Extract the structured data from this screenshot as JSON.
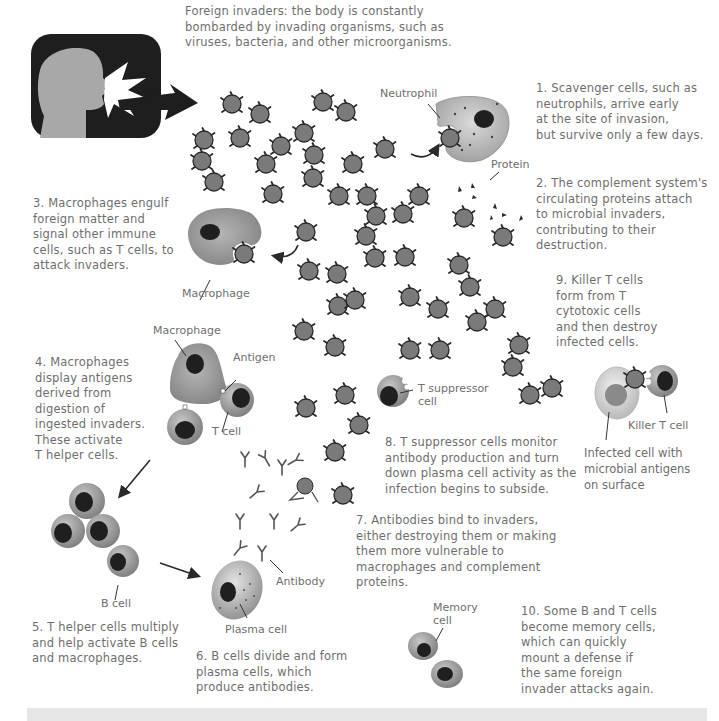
{
  "intro": {
    "text": "Foreign invaders: the body is constantly\nbombarded by invading organisms, such as\nviruses, bacteria, and other microorganisms."
  },
  "steps": [
    {
      "id": 1,
      "text": "1. Scavenger cells, such as\nneutrophils, arrive early\nat the site of invasion,\nbut survive only a few days."
    },
    {
      "id": 2,
      "text": "2. The complement system's\ncirculating proteins attach\nto microbial invaders,\ncontributing to their\ndestruction."
    },
    {
      "id": 3,
      "text": "3. Macrophages engulf\nforeign matter and\nsignal other immune\ncells, such as T cells, to\nattack invaders."
    },
    {
      "id": 4,
      "text": "4. Macrophages\ndisplay antigens\nderived from\ndigestion of\ningested invaders.\nThese activate\nT helper cells."
    },
    {
      "id": 5,
      "text": "5. T helper cells multiply\nand help activate B cells\nand macrophages."
    },
    {
      "id": 6,
      "text": "6. B cells divide and form\nplasma cells, which\nproduce antibodies."
    },
    {
      "id": 7,
      "text": "7. Antibodies bind to invaders,\neither destroying them or making\nthem more vulnerable to\nmacrophages and complement\nproteins."
    },
    {
      "id": 8,
      "text": "8. T suppressor cells monitor\nantibody production and turn\ndown plasma cell activity as the\ninfection begins to subside."
    },
    {
      "id": 9,
      "text": "9. Killer T cells\nform from T\ncytotoxic cells\nand then destroy\ninfected cells."
    },
    {
      "id": 10,
      "text": "10. Some B and T cells\nbecome memory cells,\nwhich can quickly\nmount a defense if\nthe same foreign\ninvader attacks again."
    }
  ],
  "labels": {
    "neutrophil": "Neutrophil",
    "protein": "Protein",
    "macrophage_1": "Macrophage",
    "macrophage_2": "Macrophage",
    "antigen": "Antigen",
    "t_cell": "T cell",
    "t_suppressor": "T suppressor\ncell",
    "killer_t_cell": "Killer T cell",
    "infected_cell": "Infected cell with\nmicrobial antigens\non surface",
    "b_cell": "B cell",
    "antibody": "Antibody",
    "plasma_cell": "Plasma cell",
    "memory_cell": "Memory\ncell"
  },
  "colors": {
    "invader_fill": "#7a7a7a",
    "invader_stroke": "#2a2a2a",
    "cell_fill": "#8e8e8e",
    "nucleus": "#1f1f1f",
    "panel_bg": "#1e1e1e",
    "head_fill": "#a8a8a8",
    "text": "#6e6e6e",
    "bottom_bar": "#e6e6e6"
  }
}
